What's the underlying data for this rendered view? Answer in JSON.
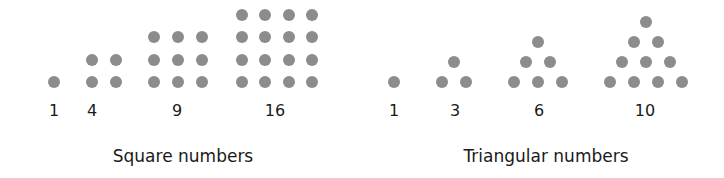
{
  "colors": {
    "background": "#ffffff",
    "dot": "#8c8c8c",
    "text": "#1a1a1a"
  },
  "panels": [
    {
      "caption": "Square numbers",
      "caption_x": 183,
      "figures": [
        {
          "label": "1",
          "label_x": 54,
          "dots": [
            [
              54,
              82
            ]
          ]
        },
        {
          "label": "4",
          "label_x": 92,
          "dots": [
            [
              92,
              60
            ],
            [
              116,
              60
            ],
            [
              92,
              82
            ],
            [
              116,
              82
            ]
          ]
        },
        {
          "label": "9",
          "label_x": 177,
          "dots": [
            [
              154,
              37
            ],
            [
              178,
              37
            ],
            [
              202,
              37
            ],
            [
              154,
              60
            ],
            [
              178,
              60
            ],
            [
              202,
              60
            ],
            [
              154,
              82
            ],
            [
              178,
              82
            ],
            [
              202,
              82
            ]
          ]
        },
        {
          "label": "16",
          "label_x": 275,
          "dots": [
            [
              242,
              15
            ],
            [
              265,
              15
            ],
            [
              289,
              15
            ],
            [
              312,
              15
            ],
            [
              242,
              37
            ],
            [
              265,
              37
            ],
            [
              289,
              37
            ],
            [
              312,
              37
            ],
            [
              242,
              60
            ],
            [
              265,
              60
            ],
            [
              289,
              60
            ],
            [
              312,
              60
            ],
            [
              242,
              82
            ],
            [
              265,
              82
            ],
            [
              289,
              82
            ],
            [
              312,
              82
            ]
          ]
        }
      ]
    },
    {
      "caption": "Triangular numbers",
      "caption_x": 546,
      "figures": [
        {
          "label": "1",
          "label_x": 394,
          "dots": [
            [
              394,
              82
            ]
          ]
        },
        {
          "label": "3",
          "label_x": 455,
          "dots": [
            [
              454,
              62
            ],
            [
              442,
              82
            ],
            [
              466,
              82
            ]
          ]
        },
        {
          "label": "6",
          "label_x": 539,
          "dots": [
            [
              538,
              42
            ],
            [
              526,
              62
            ],
            [
              550,
              62
            ],
            [
              514,
              82
            ],
            [
              538,
              82
            ],
            [
              562,
              82
            ]
          ]
        },
        {
          "label": "10",
          "label_x": 645,
          "dots": [
            [
              646,
              22
            ],
            [
              634,
              42
            ],
            [
              658,
              42
            ],
            [
              622,
              62
            ],
            [
              646,
              62
            ],
            [
              670,
              62
            ],
            [
              610,
              82
            ],
            [
              634,
              82
            ],
            [
              658,
              82
            ],
            [
              682,
              82
            ]
          ]
        }
      ]
    }
  ]
}
